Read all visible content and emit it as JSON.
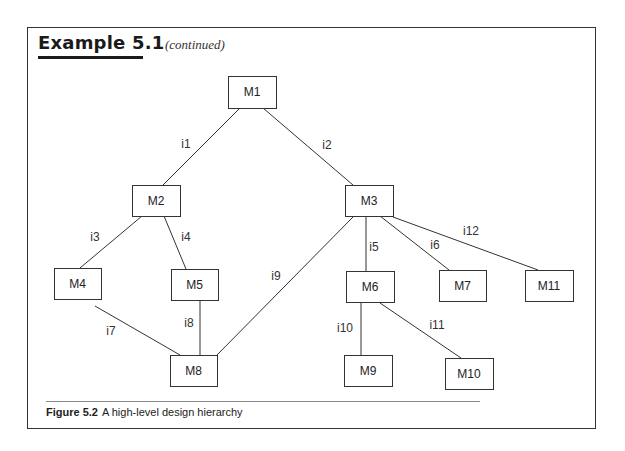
{
  "header": {
    "title": "Example 5.1",
    "subtitle": "(continued)"
  },
  "caption": {
    "label": "Figure 5.2",
    "text": "A high-level design hierarchy"
  },
  "diagram": {
    "nodes": [
      {
        "id": "M1",
        "label": "M1",
        "x": 228,
        "y": 76,
        "w": 48,
        "h": 32
      },
      {
        "id": "M2",
        "label": "M2",
        "x": 132,
        "y": 185,
        "w": 48,
        "h": 31
      },
      {
        "id": "M3",
        "label": "M3",
        "x": 345,
        "y": 185,
        "w": 48,
        "h": 31
      },
      {
        "id": "M4",
        "label": "M4",
        "x": 54,
        "y": 268,
        "w": 47,
        "h": 31
      },
      {
        "id": "M5",
        "label": "M5",
        "x": 171,
        "y": 269,
        "w": 47,
        "h": 31
      },
      {
        "id": "M6",
        "label": "M6",
        "x": 346,
        "y": 271,
        "w": 48,
        "h": 31
      },
      {
        "id": "M7",
        "label": "M7",
        "x": 439,
        "y": 270,
        "w": 47,
        "h": 31
      },
      {
        "id": "M11",
        "label": "M11",
        "x": 525,
        "y": 270,
        "w": 48,
        "h": 31
      },
      {
        "id": "M8",
        "label": "M8",
        "x": 170,
        "y": 355,
        "w": 47,
        "h": 31
      },
      {
        "id": "M9",
        "label": "M9",
        "x": 344,
        "y": 355,
        "w": 48,
        "h": 31
      },
      {
        "id": "M10",
        "label": "M10",
        "x": 445,
        "y": 358,
        "w": 48,
        "h": 31
      }
    ],
    "edges": [
      {
        "label": "i1",
        "from": "M1",
        "to": "M2",
        "x1": 240,
        "y1": 108,
        "x2": 163,
        "y2": 185,
        "lx": 186,
        "ly": 145
      },
      {
        "label": "i2",
        "from": "M1",
        "to": "M3",
        "x1": 263,
        "y1": 108,
        "x2": 353,
        "y2": 185,
        "lx": 327,
        "ly": 146
      },
      {
        "label": "i3",
        "from": "M2",
        "to": "M4",
        "x1": 142,
        "y1": 216,
        "x2": 80,
        "y2": 268,
        "lx": 95,
        "ly": 238
      },
      {
        "label": "i4",
        "from": "M2",
        "to": "M5",
        "x1": 164,
        "y1": 216,
        "x2": 186,
        "y2": 269,
        "lx": 186,
        "ly": 238
      },
      {
        "label": "i5",
        "from": "M3",
        "to": "M6",
        "x1": 366,
        "y1": 216,
        "x2": 366,
        "y2": 271,
        "lx": 374,
        "ly": 248
      },
      {
        "label": "i6",
        "from": "M3",
        "to": "M7",
        "x1": 380,
        "y1": 216,
        "x2": 449,
        "y2": 270,
        "lx": 435,
        "ly": 246
      },
      {
        "label": "i12",
        "from": "M3",
        "to": "M11",
        "x1": 393,
        "y1": 217,
        "x2": 538,
        "y2": 270,
        "lx": 471,
        "ly": 232
      },
      {
        "label": "i7",
        "from": "M4",
        "to": "M8",
        "x1": 95,
        "y1": 306,
        "x2": 180,
        "y2": 355,
        "lx": 111,
        "ly": 332
      },
      {
        "label": "i8",
        "from": "M5",
        "to": "M8",
        "x1": 200,
        "y1": 300,
        "x2": 200,
        "y2": 355,
        "lx": 189,
        "ly": 324
      },
      {
        "label": "i9",
        "from": "M3",
        "to": "M8",
        "x1": 353,
        "y1": 217,
        "x2": 217,
        "y2": 355,
        "lx": 276,
        "ly": 277
      },
      {
        "label": "i10",
        "from": "M6",
        "to": "M9",
        "x1": 361,
        "y1": 302,
        "x2": 361,
        "y2": 355,
        "lx": 345,
        "ly": 329
      },
      {
        "label": "i11",
        "from": "M6",
        "to": "M10",
        "x1": 380,
        "y1": 303,
        "x2": 461,
        "y2": 358,
        "lx": 437,
        "ly": 326
      }
    ]
  }
}
